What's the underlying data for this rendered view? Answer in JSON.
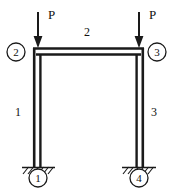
{
  "diagram": {
    "type": "structural-frame",
    "stroke_color": "#1a1a1a",
    "background_color": "#ffffff",
    "loads": [
      {
        "id": "load-left",
        "label": "P",
        "direction": "down",
        "applied_at_node": "2",
        "label_x": 49,
        "label_y": 14,
        "arrow_x": 38,
        "arrow_top": 12,
        "arrow_bottom": 44
      },
      {
        "id": "load-right",
        "label": "P",
        "direction": "down",
        "applied_at_node": "3",
        "label_x": 150,
        "label_y": 14,
        "arrow_x": 139,
        "arrow_top": 12,
        "arrow_bottom": 44
      }
    ],
    "members": [
      {
        "id": "member-1",
        "label": "1",
        "orientation": "vertical",
        "label_x": 15,
        "label_y": 112
      },
      {
        "id": "member-2",
        "label": "2",
        "orientation": "horizontal",
        "label_x": 84,
        "label_y": 30
      },
      {
        "id": "member-3",
        "label": "3",
        "orientation": "vertical",
        "label_x": 152,
        "label_y": 112
      }
    ],
    "nodes": [
      {
        "id": "node-2",
        "label": "2",
        "cx": 16,
        "cy": 52,
        "r": 9
      },
      {
        "id": "node-3",
        "label": "3",
        "cx": 157,
        "cy": 52,
        "r": 9
      },
      {
        "id": "node-1",
        "label": "1",
        "cx": 38,
        "cy": 178,
        "r": 9
      },
      {
        "id": "node-4",
        "label": "4",
        "cx": 139,
        "cy": 178,
        "r": 9
      }
    ],
    "supports": [
      {
        "id": "support-1",
        "type": "fixed",
        "at_node": "1",
        "x": 38,
        "y": 168
      },
      {
        "id": "support-4",
        "type": "fixed",
        "at_node": "4",
        "x": 139,
        "y": 168
      }
    ]
  }
}
